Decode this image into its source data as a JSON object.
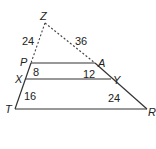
{
  "diagram": {
    "vertices": {
      "Z": {
        "label": "Z",
        "x": 45,
        "y": 23
      },
      "P": {
        "label": "P",
        "x": 31,
        "y": 63
      },
      "A": {
        "label": "A",
        "x": 95,
        "y": 63
      },
      "X": {
        "label": "X",
        "x": 26,
        "y": 79
      },
      "Y": {
        "label": "Y",
        "x": 111,
        "y": 79
      },
      "T": {
        "label": "T",
        "x": 15,
        "y": 109
      },
      "R": {
        "label": "R",
        "x": 147,
        "y": 109
      }
    },
    "segment_lengths": {
      "ZP": "24",
      "ZA": "36",
      "PX": "8",
      "AY": "12",
      "XT": "16",
      "YR": "24"
    },
    "segments": [
      {
        "from": "Z",
        "to": "P",
        "style": "dashed"
      },
      {
        "from": "Z",
        "to": "A",
        "style": "dashed"
      },
      {
        "from": "P",
        "to": "T",
        "style": "solid"
      },
      {
        "from": "A",
        "to": "R",
        "style": "solid"
      },
      {
        "from": "P",
        "to": "A",
        "style": "solid"
      },
      {
        "from": "X",
        "to": "Y",
        "style": "solid"
      },
      {
        "from": "T",
        "to": "R",
        "style": "solid"
      }
    ]
  }
}
